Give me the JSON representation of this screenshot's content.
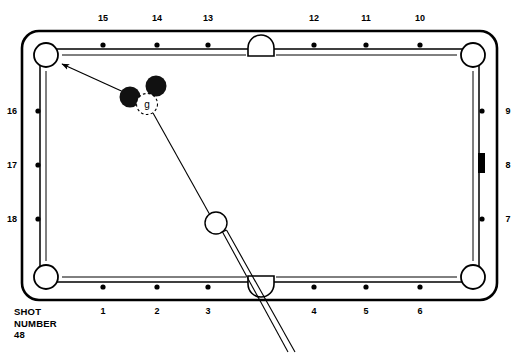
{
  "diagram": {
    "kind": "billiards-shot-diagram",
    "caption": {
      "line1": "SHOT",
      "line2": "NUMBER",
      "line3": "48"
    },
    "colors": {
      "line": "#000000",
      "cloth": "#ffffff",
      "object_ball": "#111111",
      "cue_ball_fill": "#ffffff",
      "marker": "#000000"
    },
    "table": {
      "outer": {
        "x": 22,
        "y": 31,
        "width": 475,
        "height": 269,
        "corner_radius": 17
      },
      "cushion_inset": 18,
      "rail_line_inset": 22
    },
    "rails": {
      "top": {
        "name": "top-rail",
        "diamonds": [
          {
            "label": "15",
            "x": 103
          },
          {
            "label": "14",
            "x": 157
          },
          {
            "label": "13",
            "x": 208
          },
          {
            "label": "12",
            "x": 314
          },
          {
            "label": "11",
            "x": 366
          },
          {
            "label": "10",
            "x": 420
          }
        ],
        "diamond_y": 45,
        "label_y": 13
      },
      "bottom": {
        "name": "bottom-rail",
        "diamonds": [
          {
            "label": "1",
            "x": 103
          },
          {
            "label": "2",
            "x": 157
          },
          {
            "label": "3",
            "x": 208
          },
          {
            "label": "4",
            "x": 314
          },
          {
            "label": "5",
            "x": 366
          },
          {
            "label": "6",
            "x": 420
          }
        ],
        "diamond_y": 287,
        "label_y": 306
      },
      "left": {
        "name": "left-rail",
        "diamonds": [
          {
            "label": "16",
            "y": 111
          },
          {
            "label": "17",
            "y": 165
          },
          {
            "label": "18",
            "y": 219
          }
        ],
        "diamond_x": 38,
        "label_x": 12
      },
      "right": {
        "name": "right-rail",
        "diamonds": [
          {
            "label": "9",
            "y": 111,
            "shape": "dot"
          },
          {
            "label": "8",
            "y": 165,
            "shape": "bar"
          },
          {
            "label": "7",
            "y": 219,
            "shape": "dot"
          }
        ],
        "diamond_x": 482,
        "label_x": 508
      }
    },
    "pockets": {
      "corners": [
        {
          "name": "pocket-top-left",
          "cx": 46,
          "cy": 55
        },
        {
          "name": "pocket-top-right",
          "cx": 473,
          "cy": 55
        },
        {
          "name": "pocket-bottom-left",
          "cx": 46,
          "cy": 277
        },
        {
          "name": "pocket-bottom-right",
          "cx": 473,
          "cy": 277
        }
      ],
      "sides": [
        {
          "name": "pocket-side-top",
          "cx": 261,
          "cy": 47,
          "orientation": "up"
        },
        {
          "name": "pocket-side-bottom",
          "cx": 261,
          "cy": 285,
          "orientation": "down"
        }
      ],
      "corner_radius": 12,
      "side_radius": 11
    },
    "balls": [
      {
        "name": "object-ball-1",
        "type": "object",
        "cx": 130,
        "cy": 97,
        "r": 10.5,
        "label": ""
      },
      {
        "name": "object-ball-2",
        "type": "object",
        "cx": 156,
        "cy": 86,
        "r": 10.5,
        "label": ""
      },
      {
        "name": "ghost-ball",
        "type": "ghost",
        "cx": 147,
        "cy": 104,
        "r": 10.5,
        "label": "g"
      },
      {
        "name": "cue-ball",
        "type": "cue",
        "cx": 216,
        "cy": 223,
        "r": 11,
        "label": ""
      }
    ],
    "aim_line": {
      "name": "aim-line-to-pocket",
      "from_x": 128,
      "from_y": 94,
      "to_x": 59,
      "to_y": 63,
      "arrow": true
    },
    "cue_path_line": {
      "name": "cue-ball-path-line",
      "from_x": 153,
      "from_y": 113,
      "to_x": 210,
      "to_y": 215
    },
    "cue_stick": {
      "name": "cue-stick",
      "tip_x": 224,
      "tip_y": 233,
      "butt_x": 291,
      "butt_y": 351,
      "width": 4.2
    }
  }
}
